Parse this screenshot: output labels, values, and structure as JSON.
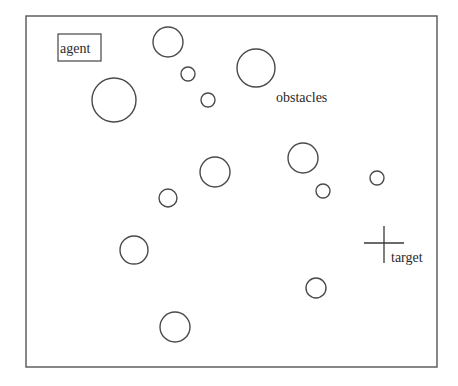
{
  "diagram": {
    "type": "environment-map",
    "frame": {
      "x": 26,
      "y": 16,
      "width": 411,
      "height": 351
    },
    "agent": {
      "label": "agent",
      "box": {
        "x": 58,
        "y": 34,
        "width": 43,
        "height": 27
      }
    },
    "target": {
      "label": "target",
      "cross": {
        "cx": 384,
        "cy": 243,
        "half_width": 20,
        "top": 226,
        "bottom": 263
      }
    },
    "obstacles": {
      "label": "obstacles",
      "circles": [
        {
          "cx": 168,
          "cy": 42,
          "r": 15
        },
        {
          "cx": 188,
          "cy": 74,
          "r": 7
        },
        {
          "cx": 208,
          "cy": 100,
          "r": 7
        },
        {
          "cx": 114,
          "cy": 100,
          "r": 22
        },
        {
          "cx": 256,
          "cy": 68,
          "r": 19
        },
        {
          "cx": 303,
          "cy": 158,
          "r": 15
        },
        {
          "cx": 215,
          "cy": 172,
          "r": 15
        },
        {
          "cx": 323,
          "cy": 191,
          "r": 7
        },
        {
          "cx": 377,
          "cy": 178,
          "r": 7
        },
        {
          "cx": 168,
          "cy": 198,
          "r": 9
        },
        {
          "cx": 134,
          "cy": 250,
          "r": 14
        },
        {
          "cx": 316,
          "cy": 288,
          "r": 10
        },
        {
          "cx": 175,
          "cy": 327,
          "r": 15
        }
      ]
    },
    "labels": {
      "agent": {
        "text": "agent",
        "x": 60,
        "y": 53
      },
      "obstacles": {
        "text": "obstacles",
        "x": 276,
        "y": 102
      },
      "target": {
        "text": "target",
        "x": 391,
        "y": 262
      }
    }
  }
}
